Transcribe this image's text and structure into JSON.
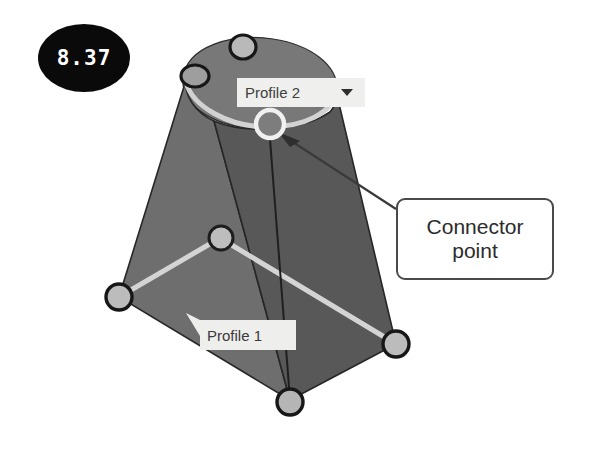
{
  "figure": {
    "badge_number": "8.37",
    "badge_color": "#0a0a0a",
    "badge_text_color": "#ffffff",
    "background_color": "#ffffff"
  },
  "labels": {
    "profile_2": {
      "text": "Profile 2",
      "dropdown_icon": "chevron-down-icon",
      "background_color": "#efefee"
    },
    "profile_1": {
      "text": "Profile 1",
      "background_color": "#eeeeed"
    }
  },
  "callout": {
    "line_1": "Connector",
    "line_2": "point",
    "border_color": "#4a4a4a",
    "background_color": "#ffffff"
  },
  "model": {
    "face_left_color": "#6e6e6e",
    "face_right_color": "#585858",
    "top_cap_color": "#7a7a7a",
    "edge_color": "#2a2a2a",
    "profile_curve_color": "#cfcfcf",
    "vertex_fill_color": "#b9b9b9",
    "vertex_stroke_color": "#1e1e1e",
    "connector_ring_color": "#f2f2f2",
    "leader_line_color": "#3a3a3a"
  }
}
